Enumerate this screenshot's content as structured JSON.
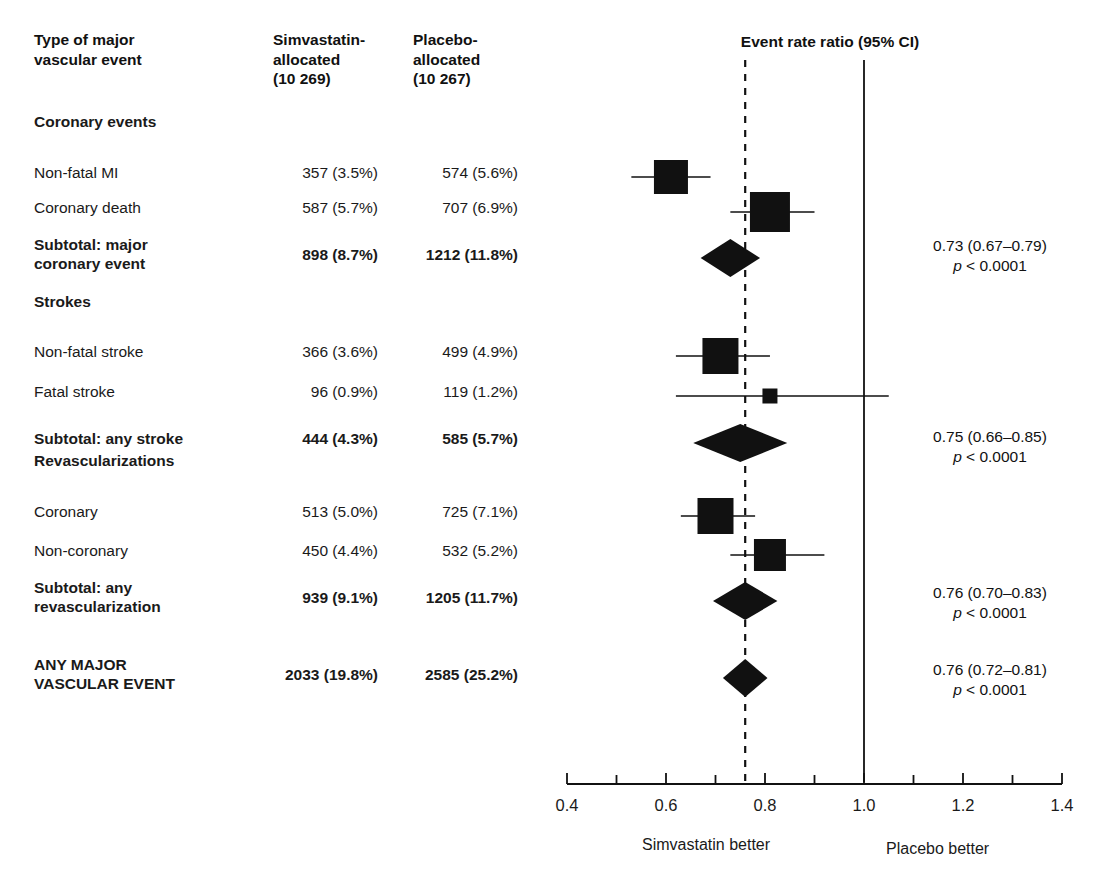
{
  "columns": {
    "event_type": "Type of major\nvascular event",
    "event_type_l1": "Type of major",
    "event_type_l2": "vascular event",
    "simvastatin_l1": "Simvastatin-",
    "simvastatin_l2": "allocated",
    "simvastatin_l3": "(10 269)",
    "placebo_l1": "Placebo-",
    "placebo_l2": "allocated",
    "placebo_l3": "(10 267)",
    "plot_title": "Event rate ratio (95% CI)"
  },
  "rows": [
    {
      "id": "coronary-events-heading",
      "label": "Coronary events",
      "bold": true,
      "heading": true,
      "simvastatin": "",
      "placebo": ""
    },
    {
      "id": "non-fatal-mi",
      "label": "Non-fatal MI",
      "bold": false,
      "heading": false,
      "simvastatin": "357 (3.5%)",
      "placebo": "574 (5.6%)"
    },
    {
      "id": "coronary-death",
      "label": "Coronary death",
      "bold": false,
      "heading": false,
      "simvastatin": "587 (5.7%)",
      "placebo": "707 (6.9%)"
    },
    {
      "id": "subtotal-major-coronary-event",
      "label": "Subtotal: major\ncoronary event",
      "label_l1": "Subtotal: major",
      "label_l2": "coronary event",
      "bold": true,
      "heading": false,
      "simvastatin": "898 (8.7%)",
      "placebo": "1212 (11.8%)"
    },
    {
      "id": "strokes-heading",
      "label": "Strokes",
      "bold": true,
      "heading": true,
      "simvastatin": "",
      "placebo": ""
    },
    {
      "id": "non-fatal-stroke",
      "label": "Non-fatal stroke",
      "bold": false,
      "heading": false,
      "simvastatin": "366 (3.6%)",
      "placebo": "499 (4.9%)"
    },
    {
      "id": "fatal-stroke",
      "label": "Fatal stroke",
      "bold": false,
      "heading": false,
      "simvastatin": "96 (0.9%)",
      "placebo": "119 (1.2%)"
    },
    {
      "id": "subtotal-any-stroke",
      "label": "Subtotal: any stroke",
      "bold": true,
      "heading": false,
      "simvastatin": "444 (4.3%)",
      "placebo": "585 (5.7%)"
    },
    {
      "id": "revascularizations-heading",
      "label": "Revascularizations",
      "bold": true,
      "heading": true,
      "simvastatin": "",
      "placebo": ""
    },
    {
      "id": "coronary-revasc",
      "label": "Coronary",
      "bold": false,
      "heading": false,
      "simvastatin": "513 (5.0%)",
      "placebo": "725 (7.1%)"
    },
    {
      "id": "non-coronary-revasc",
      "label": "Non-coronary",
      "bold": false,
      "heading": false,
      "simvastatin": "450 (4.4%)",
      "placebo": "532 (5.2%)"
    },
    {
      "id": "subtotal-any-revascularization",
      "label": "Subtotal: any\nrevascularization",
      "label_l1": "Subtotal: any",
      "label_l2": "revascularization",
      "bold": true,
      "heading": false,
      "simvastatin": "939 (9.1%)",
      "placebo": "1205 (11.7%)"
    },
    {
      "id": "any-major-vascular-event",
      "label": "ANY MAJOR\nVASCULAR EVENT",
      "label_l1": "ANY MAJOR",
      "label_l2": "VASCULAR EVENT",
      "bold": true,
      "heading": false,
      "simvastatin": "2033 (19.8%)",
      "placebo": "2585 (25.2%)"
    }
  ],
  "summary_stats": [
    {
      "id": "stat-major-coronary-event",
      "estimate": "0.73 (0.67–0.79)",
      "p_prefix": "p",
      "p_value": "< 0.0001"
    },
    {
      "id": "stat-any-stroke",
      "estimate": "0.75 (0.66–0.85)",
      "p_prefix": "p",
      "p_value": "< 0.0001"
    },
    {
      "id": "stat-any-revascularization",
      "estimate": "0.76 (0.70–0.83)",
      "p_prefix": "p",
      "p_value": "< 0.0001"
    },
    {
      "id": "stat-any-major-vascular-event",
      "estimate": "0.76 (0.72–0.81)",
      "p_prefix": "p",
      "p_value": "< 0.0001"
    }
  ],
  "axis": {
    "ticks": [
      "0.4",
      "0.6",
      "0.8",
      "1.0",
      "1.2",
      "1.4"
    ],
    "minor_tick_count": 11,
    "left_label": "Simvastatin better",
    "right_label": "Placebo better",
    "null_value": "1.0",
    "reference_dashed_value": "0.76"
  },
  "colors": {
    "marker": "#111111",
    "line": "#1a1a1a",
    "text": "#1a1a1a",
    "background": "#ffffff"
  },
  "chart_data": {
    "type": "forest",
    "title": "Event rate ratio (95% CI)",
    "xlabel": "",
    "ylabel": "",
    "xlim": [
      0.4,
      1.4
    ],
    "xticks": [
      0.4,
      0.6,
      0.8,
      1.0,
      1.2,
      1.4
    ],
    "grid": false,
    "null_line": 1.0,
    "reference_line_dashed": 0.76,
    "left_better_label": "Simvastatin better",
    "right_better_label": "Placebo better",
    "entries": [
      {
        "label": "Non-fatal MI",
        "marker": "square",
        "estimate": 0.61,
        "ci_low": 0.53,
        "ci_high": 0.69,
        "simvastatin_n": 357,
        "simvastatin_pct": 3.5,
        "placebo_n": 574,
        "placebo_pct": 5.6,
        "size": 34
      },
      {
        "label": "Coronary death",
        "marker": "square",
        "estimate": 0.81,
        "ci_low": 0.73,
        "ci_high": 0.9,
        "simvastatin_n": 587,
        "simvastatin_pct": 5.7,
        "placebo_n": 707,
        "placebo_pct": 6.9,
        "size": 40
      },
      {
        "label": "Subtotal: major coronary event",
        "marker": "diamond",
        "estimate": 0.73,
        "ci_low": 0.67,
        "ci_high": 0.79,
        "simvastatin_n": 898,
        "simvastatin_pct": 8.7,
        "placebo_n": 1212,
        "placebo_pct": 11.8,
        "p": "< 0.0001"
      },
      {
        "label": "Non-fatal stroke",
        "marker": "square",
        "estimate": 0.71,
        "ci_low": 0.62,
        "ci_high": 0.81,
        "simvastatin_n": 366,
        "simvastatin_pct": 3.6,
        "placebo_n": 499,
        "placebo_pct": 4.9,
        "size": 36
      },
      {
        "label": "Fatal stroke",
        "marker": "square",
        "estimate": 0.81,
        "ci_low": 0.62,
        "ci_high": 1.05,
        "simvastatin_n": 96,
        "simvastatin_pct": 0.9,
        "placebo_n": 119,
        "placebo_pct": 1.2,
        "size": 15
      },
      {
        "label": "Subtotal: any stroke",
        "marker": "diamond",
        "estimate": 0.75,
        "ci_low": 0.66,
        "ci_high": 0.85,
        "simvastatin_n": 444,
        "simvastatin_pct": 4.3,
        "placebo_n": 585,
        "placebo_pct": 5.7,
        "p": "< 0.0001"
      },
      {
        "label": "Coronary",
        "marker": "square",
        "estimate": 0.7,
        "ci_low": 0.63,
        "ci_high": 0.78,
        "simvastatin_n": 513,
        "simvastatin_pct": 5.0,
        "placebo_n": 725,
        "placebo_pct": 7.1,
        "size": 36
      },
      {
        "label": "Non-coronary",
        "marker": "square",
        "estimate": 0.81,
        "ci_low": 0.73,
        "ci_high": 0.92,
        "simvastatin_n": 450,
        "simvastatin_pct": 4.4,
        "placebo_n": 532,
        "placebo_pct": 5.2,
        "size": 32
      },
      {
        "label": "Subtotal: any revascularization",
        "marker": "diamond",
        "estimate": 0.76,
        "ci_low": 0.7,
        "ci_high": 0.83,
        "simvastatin_n": 939,
        "simvastatin_pct": 9.1,
        "placebo_n": 1205,
        "placebo_pct": 11.7,
        "p": "< 0.0001"
      },
      {
        "label": "ANY MAJOR VASCULAR EVENT",
        "marker": "diamond",
        "estimate": 0.76,
        "ci_low": 0.72,
        "ci_high": 0.81,
        "simvastatin_n": 2033,
        "simvastatin_pct": 19.8,
        "placebo_n": 2585,
        "placebo_pct": 25.2,
        "p": "< 0.0001"
      }
    ]
  }
}
